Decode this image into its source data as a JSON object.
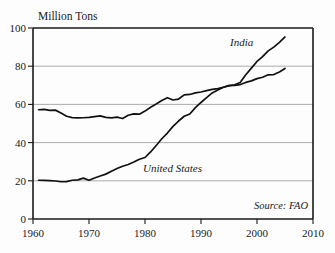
{
  "chart_data": {
    "type": "line",
    "title": "",
    "ylabel": "Million Tons",
    "xlabel": "",
    "xlim": [
      1960,
      2010
    ],
    "ylim": [
      0,
      100
    ],
    "grid": true,
    "xticks": [
      1960,
      1970,
      1980,
      1990,
      2000,
      2010
    ],
    "yticks": [
      0,
      20,
      40,
      60,
      80,
      100
    ],
    "legend_position": "inline-annotations",
    "annotations": [
      {
        "text": "India",
        "x": 1996,
        "y": 88
      },
      {
        "text": "United States",
        "x": 1988,
        "y": 32
      },
      {
        "text": "Source: FAO",
        "x": 2004,
        "y": 10
      }
    ],
    "series": [
      {
        "name": "India",
        "x": [
          1961,
          1962,
          1963,
          1964,
          1965,
          1966,
          1967,
          1968,
          1969,
          1970,
          1971,
          1972,
          1973,
          1974,
          1975,
          1976,
          1977,
          1978,
          1979,
          1980,
          1981,
          1982,
          1983,
          1984,
          1985,
          1986,
          1987,
          1988,
          1989,
          1990,
          1991,
          1992,
          1993,
          1994,
          1995,
          1996,
          1997,
          1998,
          1999,
          2000,
          2001,
          2002,
          2003,
          2004,
          2005
        ],
        "values": [
          57.2,
          57.4,
          56.9,
          57.0,
          55.5,
          53.8,
          53.1,
          52.9,
          53.0,
          53.2,
          53.6,
          54.0,
          53.2,
          52.9,
          53.3,
          52.6,
          54.3,
          55.0,
          54.9,
          56.5,
          58.5,
          60.2,
          62.0,
          63.5,
          62.3,
          62.8,
          65.0,
          65.2,
          66.0,
          66.5,
          67.2,
          67.9,
          68.3,
          69.0,
          69.8,
          70.0,
          70.4,
          71.5,
          72.3,
          73.5,
          74.2,
          75.5,
          75.6,
          77.0,
          78.8
        ]
      },
      {
        "name": "United States",
        "x": [
          1961,
          1962,
          1963,
          1964,
          1965,
          1966,
          1967,
          1968,
          1969,
          1970,
          1971,
          1972,
          1973,
          1974,
          1975,
          1976,
          1977,
          1978,
          1979,
          1980,
          1981,
          1982,
          1983,
          1984,
          1985,
          1986,
          1987,
          1988,
          1989,
          1990,
          1991,
          1992,
          1993,
          1994,
          1995,
          1996,
          1997,
          1998,
          1999,
          2000,
          2001,
          2002,
          2003,
          2004,
          2005
        ],
        "values": [
          20.3,
          20.2,
          20.1,
          19.9,
          19.5,
          19.6,
          20.3,
          20.5,
          21.4,
          20.3,
          21.5,
          22.5,
          23.5,
          25.0,
          26.4,
          27.6,
          28.5,
          29.8,
          31.3,
          32.2,
          35.1,
          38.5,
          42.0,
          45.0,
          48.5,
          51.3,
          53.8,
          55.0,
          58.3,
          61.0,
          63.5,
          66.0,
          67.5,
          69.0,
          69.8,
          70.3,
          71.5,
          75.5,
          79.0,
          82.5,
          85.0,
          88.0,
          90.0,
          92.5,
          95.3
        ]
      }
    ]
  },
  "figure": {
    "y_axis_title": "Million Tons",
    "source_note": "Source: FAO",
    "series_label_india": "India",
    "series_label_us": "United States",
    "y_tick_0": "0",
    "y_tick_20": "20",
    "y_tick_40": "40",
    "y_tick_60": "60",
    "y_tick_80": "80",
    "y_tick_100": "100",
    "x_tick_1960": "1960",
    "x_tick_1970": "1970",
    "x_tick_1980": "1980",
    "x_tick_1990": "1990",
    "x_tick_2000": "2000",
    "x_tick_2010": "2010",
    "colors": {
      "line": "#111111",
      "grid": "#8a8a8a",
      "frame": "#1a1a1a",
      "background": "#fdfdfd"
    }
  }
}
